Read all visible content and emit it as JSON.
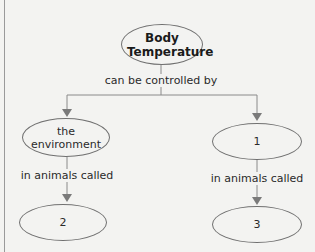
{
  "diagram": {
    "type": "concept-map",
    "root": {
      "label": "Body Temperature"
    },
    "root_link": {
      "label": "can be controlled by"
    },
    "branches": [
      {
        "node": {
          "label": "the environment"
        },
        "link": {
          "label": "in animals called"
        },
        "child": {
          "label": "2"
        }
      },
      {
        "node": {
          "label": "1"
        },
        "link": {
          "label": "in animals called"
        },
        "child": {
          "label": "3"
        }
      }
    ],
    "colors": {
      "line": "#7a7a7a",
      "background": "#f3f3f1",
      "text": "#2a2a2a"
    }
  }
}
